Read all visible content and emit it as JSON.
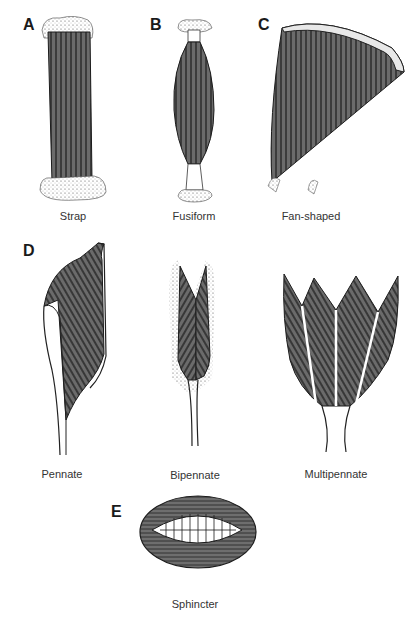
{
  "figure": {
    "colors": {
      "muscle_fill": "#6b6b6b",
      "fiber_line": "#1c1c1c",
      "tendon": "#ffffff",
      "stipple": "#9a9a9a",
      "background": "#ffffff"
    },
    "panels": [
      {
        "letter": "A",
        "caption": "Strap"
      },
      {
        "letter": "B",
        "caption": "Fusiform"
      },
      {
        "letter": "C",
        "caption": "Fan-shaped"
      },
      {
        "letter": "D",
        "caption": "Pennate"
      },
      {
        "letter": "",
        "caption": "Bipennate"
      },
      {
        "letter": "",
        "caption": "Multipennate"
      },
      {
        "letter": "E",
        "caption": "Sphincter"
      }
    ]
  }
}
